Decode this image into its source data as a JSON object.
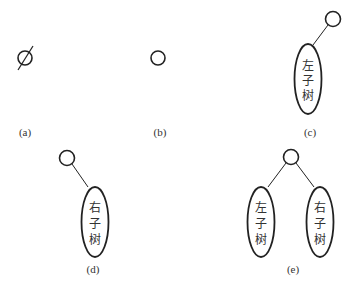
{
  "panels": [
    {
      "id": "a",
      "label": "(a)",
      "description": "empty tree",
      "nodes": [
        "∅"
      ]
    },
    {
      "id": "b",
      "label": "(b)",
      "description": "single root node"
    },
    {
      "id": "c",
      "label": "(c)",
      "description": "root with left subtree only",
      "subtrees": [
        {
          "text": [
            "左",
            "子",
            "树"
          ]
        }
      ]
    },
    {
      "id": "d",
      "label": "(d)",
      "description": "root with right subtree only",
      "subtrees": [
        {
          "text": [
            "右",
            "子",
            "树"
          ]
        }
      ]
    },
    {
      "id": "e",
      "label": "(e)",
      "description": "root with left and right subtrees",
      "subtrees": [
        {
          "text": [
            "左",
            "子",
            "树"
          ]
        },
        {
          "text": [
            "右",
            "子",
            "树"
          ]
        }
      ]
    }
  ]
}
